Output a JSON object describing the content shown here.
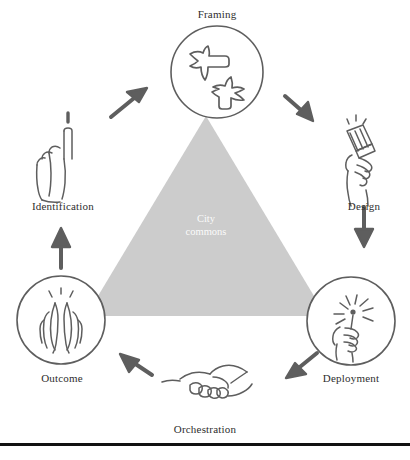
{
  "figure": {
    "type": "cycle-diagram",
    "background_color": "#ffffff",
    "stroke_color": "#585858",
    "triangle_fill": "#cccccc",
    "label_color": "#2e2e2e",
    "center_label_color": "#ffffff"
  },
  "center": {
    "line1": "City",
    "line2": "commons",
    "shape": "triangle"
  },
  "nodes": [
    {
      "id": "framing",
      "label": "Framing",
      "icon": "birds-icon",
      "in_circle": true,
      "position": "top"
    },
    {
      "id": "design",
      "label": "Design",
      "icon": "hand-paintbrush-icon",
      "in_circle": false,
      "position": "right-upper"
    },
    {
      "id": "deployment",
      "label": "Deployment",
      "icon": "hand-sparkler-icon",
      "in_circle": true,
      "position": "right-lower"
    },
    {
      "id": "orchestration",
      "label": "Orchestration",
      "icon": "handshake-icon",
      "in_circle": false,
      "position": "bottom"
    },
    {
      "id": "outcome",
      "label": "Outcome",
      "icon": "praying-hands-icon",
      "in_circle": true,
      "position": "left-lower"
    },
    {
      "id": "identification",
      "label": "Identification",
      "icon": "pointing-up-hand-icon",
      "in_circle": false,
      "position": "left-upper"
    }
  ],
  "arrows": [
    {
      "id": "identification-to-framing",
      "direction": "up-right"
    },
    {
      "id": "framing-to-design",
      "direction": "down-right"
    },
    {
      "id": "design-to-deployment",
      "direction": "down"
    },
    {
      "id": "deployment-to-orchestration",
      "direction": "down-left"
    },
    {
      "id": "orchestration-to-outcome",
      "direction": "up-left"
    },
    {
      "id": "outcome-to-identification",
      "direction": "up"
    }
  ]
}
